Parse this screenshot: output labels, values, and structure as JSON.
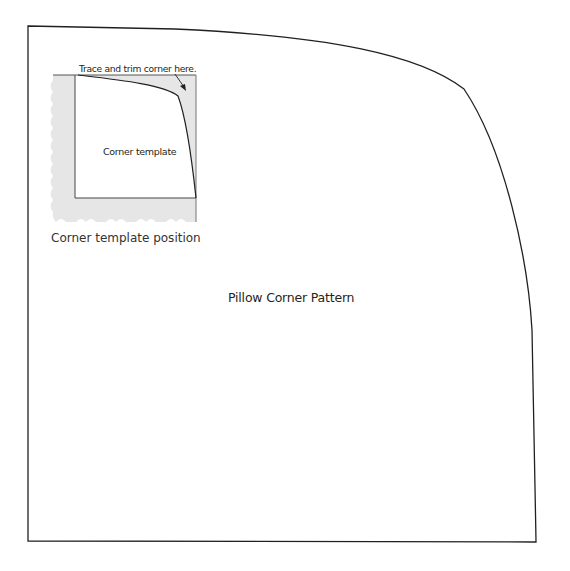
{
  "diagram": {
    "title": "Pillow Corner Pattern",
    "inset": {
      "template_label": "Corner template",
      "instruction_label": "Trace and trim corner here.",
      "caption": "Corner template position"
    },
    "colors": {
      "outline": "#231f20",
      "inset_fill": "#e6e6e6",
      "background": "#ffffff"
    }
  }
}
